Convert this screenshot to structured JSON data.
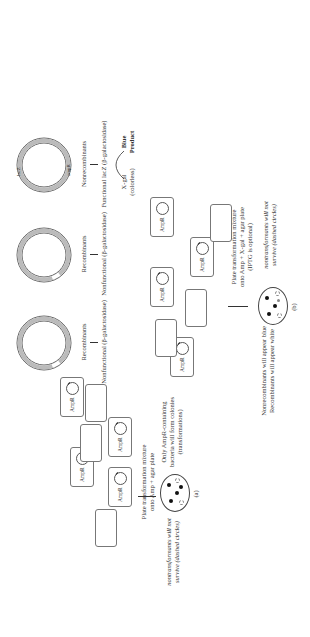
{
  "figure": {
    "rotation_deg": -90,
    "plasmids": [
      {
        "id": "p1",
        "genes": [
          "lacZ",
          "ampR"
        ],
        "label": "Nonrecombinants",
        "arrow_result": "Functional lacZ (β-galactosidase)",
        "insert": false
      },
      {
        "id": "p2",
        "genes": [
          "lacZ",
          "lacZ",
          "ampR"
        ],
        "label": "Recombinants",
        "arrow_result": "Nonfunctional (β-galactosidase)",
        "insert": true
      },
      {
        "id": "p3",
        "genes": [
          "lacZ",
          "lacZ",
          "ampR"
        ],
        "label": "Recombinants",
        "arrow_result": "Nonfunctional (β-galactosidase)",
        "insert": true
      }
    ],
    "xgal_reaction": {
      "substrate": "X-gal",
      "substrate_note": "(colorless)",
      "product": "Blue",
      "product_line2": "Product"
    },
    "panel_a": {
      "cells": [
        {
          "label": "AmpR",
          "has_plasmid": true,
          "insert": false
        },
        {
          "label": "AmpR",
          "has_plasmid": true,
          "insert": true
        },
        {
          "label": "AmpR",
          "has_plasmid": true,
          "insert": true
        },
        {
          "label": "AmpR",
          "has_plasmid": true,
          "insert": true
        },
        {
          "label": "",
          "has_plasmid": false
        },
        {
          "label": "",
          "has_plasmid": false
        },
        {
          "label": "",
          "has_plasmid": false
        }
      ],
      "step_line1": "Plate transformation mixture",
      "step_line2": "onto Amp + agar plate",
      "left_note_line1": "nontransformants will not",
      "left_note_line2": "survive (dashed circles)",
      "right_note_line1": "Only AmpR-containing",
      "right_note_line2": "bacteria will form colonies",
      "right_note_line3": "(transformations)",
      "caption": "(a)"
    },
    "panel_b": {
      "cells": [
        {
          "label": "AmpR",
          "has_plasmid": true,
          "insert": false
        },
        {
          "label": "AmpR",
          "has_plasmid": true,
          "insert": true
        },
        {
          "label": "AmpR",
          "has_plasmid": true,
          "insert": true
        },
        {
          "label": "AmpR",
          "has_plasmid": true,
          "insert": true
        },
        {
          "label": "",
          "has_plasmid": false
        },
        {
          "label": "",
          "has_plasmid": false
        },
        {
          "label": "",
          "has_plasmid": false
        }
      ],
      "step_line1": "Plate transformation mixture",
      "step_line2": "onto Amp + X-gal + agar plate",
      "step_line3": "(IPTG is optional)",
      "left_note_line1": "nontransformants will not",
      "left_note_line2": "survive (dashed circles)",
      "right_note_line1": "Nonrecombinants will appear blue",
      "right_note_line2": "Recombinants will appear white",
      "caption": "(b)"
    }
  }
}
